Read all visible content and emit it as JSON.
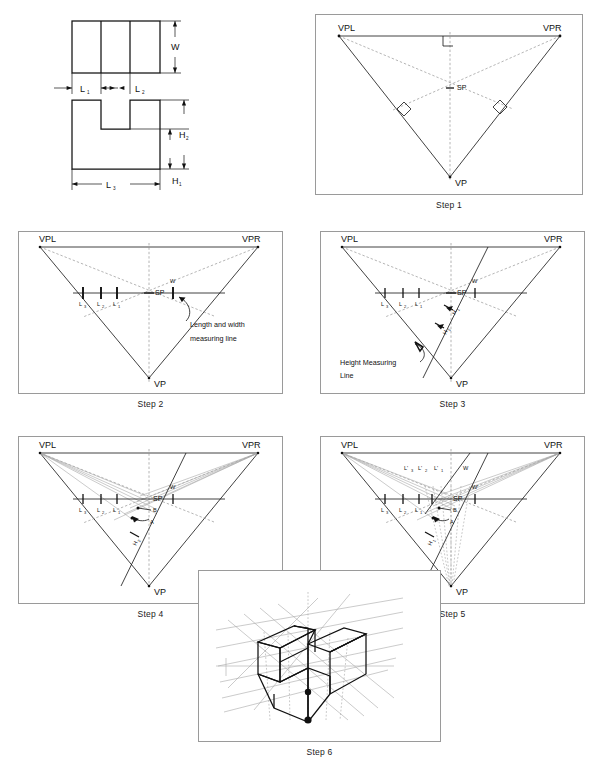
{
  "figure": {
    "panel_count": 7
  },
  "orthographic": {
    "name": "orthographic-views",
    "top_view_label": "top-view",
    "front_view_label": "front-view",
    "dimensions": {
      "width": "W",
      "length_1": "L",
      "length_1_sub": "1",
      "length_2": "L",
      "length_2_sub": "2",
      "length_3": "L",
      "length_3_sub": "3",
      "height_1": "H",
      "height_1_sub": "1",
      "height_2": "H",
      "height_2_sub": "2"
    }
  },
  "common_labels": {
    "vpl": "VPL",
    "vpr": "VPR",
    "vp": "VP",
    "sp": "SP",
    "w": "W",
    "w_prime": "W'",
    "l": "L",
    "l1_sub": "1",
    "l2_sub": "2",
    "l3_sub": "3",
    "h": "H",
    "h1_sub": "1",
    "h2_sub": "2",
    "l_prime": "L'",
    "point_a": "A",
    "point_b": "B"
  },
  "steps": [
    {
      "id": "step-1",
      "caption": "Step 1",
      "description": "Station point located by perpendiculars from each vertex",
      "labels": [
        "VPL",
        "VPR",
        "VP",
        "SP"
      ],
      "has_right_angle_marks": true,
      "right_angle_mark_count": 3
    },
    {
      "id": "step-2",
      "caption": "Step 2",
      "description": "Length and width measuring line drawn through SP",
      "annotation": [
        "Length and width",
        "measuring line"
      ],
      "measure_labels_left": [
        "L3",
        "L2",
        "L1"
      ],
      "measure_labels_right": [
        "W"
      ],
      "tick_count": 4
    },
    {
      "id": "step-3",
      "caption": "Step 3",
      "description": "Height measuring line drawn from SP toward VP side",
      "annotation": [
        "Height Measuring",
        "Line"
      ],
      "measure_labels_left": [
        "L3",
        "L2",
        "L1"
      ],
      "measure_labels_right": [
        "W"
      ],
      "height_labels": [
        "H1",
        "H2"
      ]
    },
    {
      "id": "step-4",
      "caption": "Step 4",
      "description": "Project measuring points to VPL and VPR to locate points A and B",
      "point_labels": [
        "A",
        "B"
      ],
      "measure_labels_left": [
        "L3",
        "L2",
        "L1"
      ],
      "measure_labels_right": [
        "W"
      ],
      "height_labels": [
        "H2"
      ]
    },
    {
      "id": "step-5",
      "caption": "Step 5",
      "description": "Transfer lengths and width to the upper measuring line and drop lines to VP",
      "upper_labels": [
        "L'3",
        "L'2",
        "L'1",
        "W'"
      ],
      "point_labels": [
        "A",
        "B"
      ],
      "measure_labels_left": [
        "L3",
        "L2",
        "L1"
      ],
      "measure_labels_right": [
        "W",
        "W'"
      ],
      "height_labels": [
        "H1"
      ]
    },
    {
      "id": "step-6",
      "caption": "Step 6",
      "description": "Completed three-point perspective of the notched block",
      "has_construction_lines": true,
      "marker_dot_count": 2
    }
  ],
  "colors": {
    "ink": "#111111",
    "frame": "#9a9a9a",
    "construction": "#a8a8a8",
    "dashed": "#8d8d8d",
    "background": "#ffffff"
  }
}
